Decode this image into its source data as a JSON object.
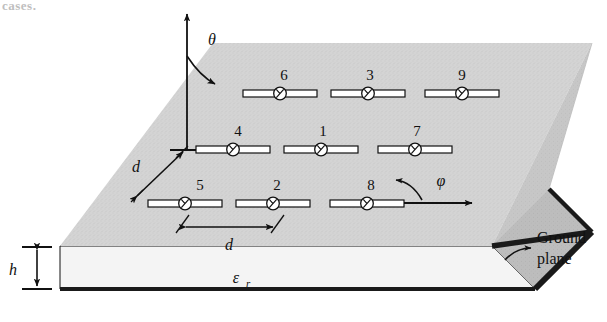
{
  "figure": {
    "title_fragment": "cases.",
    "type": "microstrip-dipole-array-on-grounded-substrate"
  },
  "axes": {
    "theta_label": "θ",
    "phi_label": "φ",
    "z_axis_name": "vertical-axis"
  },
  "dimensions": {
    "spacing_horizontal": "d",
    "spacing_vertical": "d",
    "substrate_height": "h",
    "permittivity": "ε",
    "permittivity_sub": "r"
  },
  "callouts": {
    "ground_plane_line1": "Ground",
    "ground_plane_line2": "plane"
  },
  "array": {
    "rows": [
      {
        "name": "top-row",
        "elements": [
          "6",
          "3",
          "9"
        ]
      },
      {
        "name": "middle-row",
        "elements": [
          "4",
          "1",
          "7"
        ]
      },
      {
        "name": "bottom-row",
        "elements": [
          "5",
          "2",
          "8"
        ]
      }
    ]
  },
  "colors": {
    "substrate_top": "#d3d3d3",
    "substrate_side": "#b9b9b9",
    "substrate_front": "#f2f2f2",
    "ground_plane": "#1a1a1a",
    "ink": "#111111",
    "dipole_fill": "#ffffff"
  }
}
